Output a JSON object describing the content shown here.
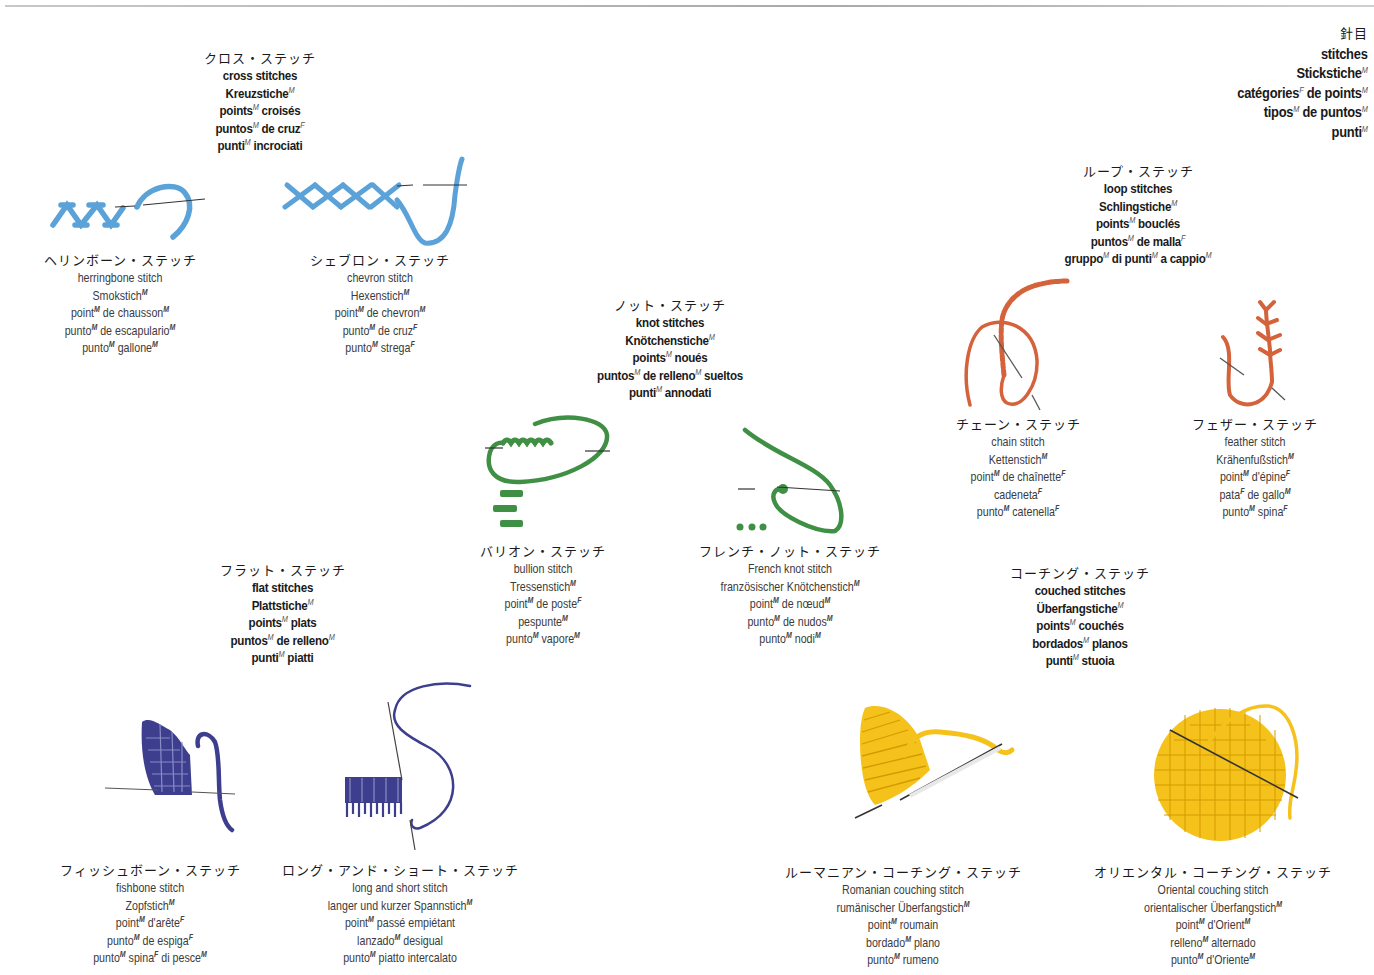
{
  "header": {
    "lines": [
      {
        "jp": true,
        "segs": [
          [
            "針目",
            ""
          ]
        ]
      },
      {
        "segs": [
          [
            "stitches",
            ""
          ]
        ]
      },
      {
        "segs": [
          [
            "Stickstiche",
            "M"
          ]
        ]
      },
      {
        "segs": [
          [
            "catégories",
            "F"
          ],
          [
            " de points",
            "M"
          ]
        ]
      },
      {
        "segs": [
          [
            "tipos",
            "M"
          ],
          [
            " de puntos",
            "M"
          ]
        ]
      },
      {
        "segs": [
          [
            "punti",
            "M"
          ]
        ]
      }
    ]
  },
  "categories": [
    {
      "id": "cross-stitches",
      "lines": [
        {
          "jp": true,
          "segs": [
            [
              "クロス・ステッチ",
              ""
            ]
          ]
        },
        {
          "segs": [
            [
              "cross stitches",
              ""
            ]
          ]
        },
        {
          "segs": [
            [
              "Kreuzstiche",
              "M"
            ]
          ]
        },
        {
          "segs": [
            [
              "points",
              "M"
            ],
            [
              " croisés",
              ""
            ]
          ]
        },
        {
          "segs": [
            [
              "puntos",
              "M"
            ],
            [
              " de cruz",
              "F"
            ]
          ]
        },
        {
          "segs": [
            [
              "punti",
              "M"
            ],
            [
              " incrociati",
              ""
            ]
          ]
        }
      ]
    },
    {
      "id": "knot-stitches",
      "lines": [
        {
          "jp": true,
          "segs": [
            [
              "ノット・ステッチ",
              ""
            ]
          ]
        },
        {
          "segs": [
            [
              "knot stitches",
              ""
            ]
          ]
        },
        {
          "segs": [
            [
              "Knötchenstiche",
              "M"
            ]
          ]
        },
        {
          "segs": [
            [
              "points",
              "M"
            ],
            [
              " noués",
              ""
            ]
          ]
        },
        {
          "segs": [
            [
              "puntos",
              "M"
            ],
            [
              " de relleno",
              "M"
            ],
            [
              " sueltos",
              ""
            ]
          ]
        },
        {
          "segs": [
            [
              "punti",
              "M"
            ],
            [
              " annodati",
              ""
            ]
          ]
        }
      ]
    },
    {
      "id": "loop-stitches",
      "lines": [
        {
          "jp": true,
          "segs": [
            [
              "ループ・ステッチ",
              ""
            ]
          ]
        },
        {
          "segs": [
            [
              "loop stitches",
              ""
            ]
          ]
        },
        {
          "segs": [
            [
              "Schlingstiche",
              "M"
            ]
          ]
        },
        {
          "segs": [
            [
              "points",
              "M"
            ],
            [
              " bouclés",
              ""
            ]
          ]
        },
        {
          "segs": [
            [
              "puntos",
              "M"
            ],
            [
              " de malla",
              "F"
            ]
          ]
        },
        {
          "segs": [
            [
              "gruppo",
              "M"
            ],
            [
              " di punti",
              "M"
            ],
            [
              " a cappio",
              "M"
            ]
          ]
        }
      ]
    },
    {
      "id": "flat-stitches",
      "lines": [
        {
          "jp": true,
          "segs": [
            [
              "フラット・ステッチ",
              ""
            ]
          ]
        },
        {
          "segs": [
            [
              "flat stitches",
              ""
            ]
          ]
        },
        {
          "segs": [
            [
              "Plattstiche",
              "M"
            ]
          ]
        },
        {
          "segs": [
            [
              "points",
              "M"
            ],
            [
              " plats",
              ""
            ]
          ]
        },
        {
          "segs": [
            [
              "puntos",
              "M"
            ],
            [
              " de relleno",
              "M"
            ]
          ]
        },
        {
          "segs": [
            [
              "punti",
              "M"
            ],
            [
              " piatti",
              ""
            ]
          ]
        }
      ]
    },
    {
      "id": "couched-stitches",
      "lines": [
        {
          "jp": true,
          "segs": [
            [
              "コーチング・ステッチ",
              ""
            ]
          ]
        },
        {
          "segs": [
            [
              "couched stitches",
              ""
            ]
          ]
        },
        {
          "segs": [
            [
              "Überfangstiche",
              "M"
            ]
          ]
        },
        {
          "segs": [
            [
              "points",
              "M"
            ],
            [
              " couchés",
              ""
            ]
          ]
        },
        {
          "segs": [
            [
              "bordados",
              "M"
            ],
            [
              " planos",
              ""
            ]
          ]
        },
        {
          "segs": [
            [
              "punti",
              "M"
            ],
            [
              " stuoia",
              ""
            ]
          ]
        }
      ]
    }
  ],
  "items": [
    {
      "id": "herringbone",
      "color": "#5aa2d8",
      "lines": [
        {
          "jp": true,
          "segs": [
            [
              "ヘリンボーン・ステッチ",
              ""
            ]
          ]
        },
        {
          "segs": [
            [
              "herringbone stitch",
              ""
            ]
          ]
        },
        {
          "segs": [
            [
              "Smokstich",
              "M"
            ]
          ]
        },
        {
          "segs": [
            [
              "point",
              "M"
            ],
            [
              " de chausson",
              "M"
            ]
          ]
        },
        {
          "segs": [
            [
              "punto",
              "M"
            ],
            [
              " de escapulario",
              "M"
            ]
          ]
        },
        {
          "segs": [
            [
              "punto",
              "M"
            ],
            [
              " gallone",
              "M"
            ]
          ]
        }
      ]
    },
    {
      "id": "chevron",
      "color": "#5aa2d8",
      "lines": [
        {
          "jp": true,
          "segs": [
            [
              "シェブロン・ステッチ",
              ""
            ]
          ]
        },
        {
          "segs": [
            [
              "chevron stitch",
              ""
            ]
          ]
        },
        {
          "segs": [
            [
              "Hexenstich",
              "M"
            ]
          ]
        },
        {
          "segs": [
            [
              "point",
              "M"
            ],
            [
              " de chevron",
              "M"
            ]
          ]
        },
        {
          "segs": [
            [
              "punto",
              "M"
            ],
            [
              " de cruz",
              "F"
            ]
          ]
        },
        {
          "segs": [
            [
              "punto",
              "M"
            ],
            [
              " strega",
              "F"
            ]
          ]
        }
      ]
    },
    {
      "id": "bullion",
      "color": "#3f8f45",
      "lines": [
        {
          "jp": true,
          "segs": [
            [
              "バリオン・ステッチ",
              ""
            ]
          ]
        },
        {
          "segs": [
            [
              "bullion stitch",
              ""
            ]
          ]
        },
        {
          "segs": [
            [
              "Tressenstich",
              "M"
            ]
          ]
        },
        {
          "segs": [
            [
              "point",
              "M"
            ],
            [
              " de poste",
              "F"
            ]
          ]
        },
        {
          "segs": [
            [
              "pespunte",
              "M"
            ]
          ]
        },
        {
          "segs": [
            [
              "punto",
              "M"
            ],
            [
              " vapore",
              "M"
            ]
          ]
        }
      ]
    },
    {
      "id": "french-knot",
      "color": "#3f8f45",
      "lines": [
        {
          "jp": true,
          "segs": [
            [
              "フレンチ・ノット・ステッチ",
              ""
            ]
          ]
        },
        {
          "segs": [
            [
              "French knot stitch",
              ""
            ]
          ]
        },
        {
          "segs": [
            [
              "französischer Knötchenstich",
              "M"
            ]
          ]
        },
        {
          "segs": [
            [
              "point",
              "M"
            ],
            [
              " de nœud",
              "M"
            ]
          ]
        },
        {
          "segs": [
            [
              "punto",
              "M"
            ],
            [
              " de nudos",
              "M"
            ]
          ]
        },
        {
          "segs": [
            [
              "punto",
              "M"
            ],
            [
              " nodi",
              "M"
            ]
          ]
        }
      ]
    },
    {
      "id": "chain",
      "color": "#d4623a",
      "lines": [
        {
          "jp": true,
          "segs": [
            [
              "チェーン・ステッチ",
              ""
            ]
          ]
        },
        {
          "segs": [
            [
              "chain stitch",
              ""
            ]
          ]
        },
        {
          "segs": [
            [
              "Kettenstich",
              "M"
            ]
          ]
        },
        {
          "segs": [
            [
              "point",
              "M"
            ],
            [
              " de chaînette",
              "F"
            ]
          ]
        },
        {
          "segs": [
            [
              "cadeneta",
              "F"
            ]
          ]
        },
        {
          "segs": [
            [
              "punto",
              "M"
            ],
            [
              " catenella",
              "F"
            ]
          ]
        }
      ]
    },
    {
      "id": "feather",
      "color": "#d4623a",
      "lines": [
        {
          "jp": true,
          "segs": [
            [
              "フェザー・ステッチ",
              ""
            ]
          ]
        },
        {
          "segs": [
            [
              "feather stitch",
              ""
            ]
          ]
        },
        {
          "segs": [
            [
              "Krähenfußstich",
              "M"
            ]
          ]
        },
        {
          "segs": [
            [
              "point",
              "M"
            ],
            [
              " d'épine",
              "F"
            ]
          ]
        },
        {
          "segs": [
            [
              "pata",
              "F"
            ],
            [
              " de gallo",
              "M"
            ]
          ]
        },
        {
          "segs": [
            [
              "punto",
              "M"
            ],
            [
              " spina",
              "F"
            ]
          ]
        }
      ]
    },
    {
      "id": "fishbone",
      "color": "#3d3f8e",
      "lines": [
        {
          "jp": true,
          "segs": [
            [
              "フィッシュボーン・ステッチ",
              ""
            ]
          ]
        },
        {
          "segs": [
            [
              "fishbone stitch",
              ""
            ]
          ]
        },
        {
          "segs": [
            [
              "Zopfstich",
              "M"
            ]
          ]
        },
        {
          "segs": [
            [
              "point",
              "M"
            ],
            [
              " d'arête",
              "F"
            ]
          ]
        },
        {
          "segs": [
            [
              "punto",
              "M"
            ],
            [
              " de espiga",
              "F"
            ]
          ]
        },
        {
          "segs": [
            [
              "punto",
              "M"
            ],
            [
              " spina",
              "F"
            ],
            [
              " di pesce",
              "M"
            ]
          ]
        }
      ]
    },
    {
      "id": "long-and-short",
      "color": "#3d3f8e",
      "lines": [
        {
          "jp": true,
          "segs": [
            [
              "ロング・アンド・ショート・ステッチ",
              ""
            ]
          ]
        },
        {
          "segs": [
            [
              "long and short stitch",
              ""
            ]
          ]
        },
        {
          "segs": [
            [
              "langer und kurzer Spannstich",
              "M"
            ]
          ]
        },
        {
          "segs": [
            [
              "point",
              "M"
            ],
            [
              " passé empiétant",
              ""
            ]
          ]
        },
        {
          "segs": [
            [
              "lanzado",
              "M"
            ],
            [
              " desigual",
              ""
            ]
          ]
        },
        {
          "segs": [
            [
              "punto",
              "M"
            ],
            [
              " piatto intercalato",
              ""
            ]
          ]
        }
      ]
    },
    {
      "id": "romanian-couching",
      "color": "#f5c21b",
      "lines": [
        {
          "jp": true,
          "segs": [
            [
              "ルーマニアン・コーチング・ステッチ",
              ""
            ]
          ]
        },
        {
          "segs": [
            [
              "Romanian couching stitch",
              ""
            ]
          ]
        },
        {
          "segs": [
            [
              "rumänischer Überfangstich",
              "M"
            ]
          ]
        },
        {
          "segs": [
            [
              "point",
              "M"
            ],
            [
              " roumain",
              ""
            ]
          ]
        },
        {
          "segs": [
            [
              "bordado",
              "M"
            ],
            [
              " plano",
              ""
            ]
          ]
        },
        {
          "segs": [
            [
              "punto",
              "M"
            ],
            [
              " rumeno",
              ""
            ]
          ]
        }
      ]
    },
    {
      "id": "oriental-couching",
      "color": "#f5c21b",
      "lines": [
        {
          "jp": true,
          "segs": [
            [
              "オリエンタル・コーチング・ステッチ",
              ""
            ]
          ]
        },
        {
          "segs": [
            [
              "Oriental couching stitch",
              ""
            ]
          ]
        },
        {
          "segs": [
            [
              "orientalischer Überfangstich",
              "M"
            ]
          ]
        },
        {
          "segs": [
            [
              "point",
              "M"
            ],
            [
              " d'Orient",
              "M"
            ]
          ]
        },
        {
          "segs": [
            [
              "relleno",
              "M"
            ],
            [
              " alternado",
              ""
            ]
          ]
        },
        {
          "segs": [
            [
              "punto",
              "M"
            ],
            [
              " d'Oriente",
              "M"
            ]
          ]
        }
      ]
    }
  ],
  "colors": {
    "blue": "#5aa2d8",
    "green": "#3f8f45",
    "orange": "#d4623a",
    "navy": "#3d3f8e",
    "yellow": "#f5c21b",
    "needle": "#4a4a4a"
  }
}
